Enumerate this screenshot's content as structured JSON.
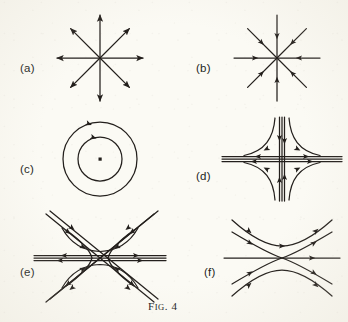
{
  "figure": {
    "caption_first_letter": "F",
    "caption_small_caps": "IG",
    "caption_rest": ". 4",
    "caption_full": "Fig. 4",
    "background_color": "#fbfaf4",
    "ink_color": "#231f1c"
  },
  "panels": [
    {
      "id": "a",
      "label": "(a)",
      "type": "unstable-node",
      "description": "eight straight rays radiating outward from a common point, arrowheads at the outer tips pointing away from the centre",
      "center": {
        "x": 100,
        "y": 58
      },
      "ray_length": 44,
      "ray_count": 8,
      "flow_direction": "outward",
      "label_position": {
        "x": 20,
        "y": 62
      }
    },
    {
      "id": "b",
      "label": "(b)",
      "type": "stable-node",
      "description": "eight straight rays converging on a common point, arrowheads part-way along each ray pointing toward the centre",
      "center": {
        "x": 277,
        "y": 58
      },
      "ray_length": 44,
      "ray_count": 8,
      "flow_direction": "inward",
      "label_position": {
        "x": 196,
        "y": 62
      }
    },
    {
      "id": "c",
      "label": "(c)",
      "type": "centre",
      "description": "two concentric circles about a marked point, each carrying a single arrowhead indicating clockwise circulation",
      "center": {
        "x": 100,
        "y": 159
      },
      "outer_radius": 37,
      "inner_radius": 22,
      "dot_size": 3,
      "flow_direction": "clockwise",
      "label_position": {
        "x": 20,
        "y": 163
      }
    },
    {
      "id": "d",
      "label": "(d)",
      "type": "saddle-point",
      "description": "hyperbolic trajectories in four quadrants with vertical separatrices flowing in and horizontal separatrices flowing out",
      "center": {
        "x": 282,
        "y": 159
      },
      "half_width": 60,
      "half_height": 42,
      "incoming_axis": "vertical",
      "outgoing_axis": "horizontal",
      "label_position": {
        "x": 196,
        "y": 170
      }
    },
    {
      "id": "e",
      "label": "(e)",
      "type": "saddle-with-diagonal-separatrices",
      "description": "a crossing pair of diagonal separatrices together with horizontal separatrices and hyperbolic trajectories filling the sectors",
      "center": {
        "x": 100,
        "y": 258
      },
      "half_width": 62,
      "half_height": 44,
      "incoming_axis": "diagonal",
      "outgoing_axis": "horizontal",
      "label_position": {
        "x": 20,
        "y": 266
      }
    },
    {
      "id": "f",
      "label": "(f)",
      "type": "degenerate-saddle",
      "description": "a horizontal line through the critical point with hyperbolic branches crossing it and outer arcs curving above and below",
      "center": {
        "x": 282,
        "y": 258
      },
      "half_width": 58,
      "half_height": 42,
      "label_position": {
        "x": 204,
        "y": 266
      }
    }
  ]
}
